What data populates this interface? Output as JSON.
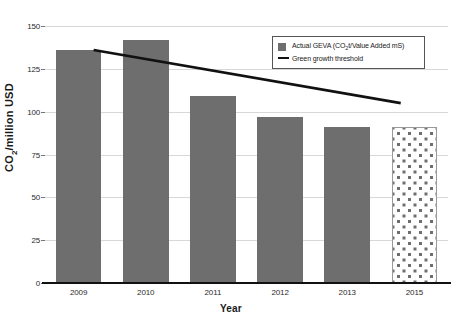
{
  "chart_data": {
    "type": "bar",
    "title": "",
    "xlabel": "Year",
    "ylabel": "CO2/million USD",
    "ylabel_parts": {
      "pre": "CO",
      "sub": "2",
      "post": "/million USD"
    },
    "categories": [
      "2009",
      "2010",
      "2011",
      "2012",
      "2013",
      "2015"
    ],
    "ylim": [
      0,
      150
    ],
    "yticks": [
      0,
      25,
      50,
      75,
      100,
      125,
      150
    ],
    "ytick_labels": [
      "0",
      "25",
      "50",
      "75",
      "100",
      "125",
      "150"
    ],
    "grid": true,
    "legend_position": "top-right",
    "series": [
      {
        "name": "Actual GEVA (CO2t/Value Added mS)",
        "name_parts": {
          "pre": "Actual GEVA (CO",
          "sub": "2",
          "post": "t/Value Added mS)"
        },
        "type": "bar",
        "color": "#6e6e6e",
        "values": [
          136,
          142,
          109,
          97,
          91,
          91
        ],
        "point_styles": [
          "solid",
          "solid",
          "solid",
          "solid",
          "solid",
          "dotted"
        ]
      },
      {
        "name": "Green growth threshold",
        "type": "line",
        "color": "#111111",
        "x": [
          "2009",
          "2015"
        ],
        "values": [
          136,
          105
        ]
      }
    ]
  },
  "legend": {
    "items": [
      {
        "label": "Actual GEVA (CO2t/Value Added mS)",
        "marker": "square-swatch"
      },
      {
        "label": "Green growth threshold",
        "marker": "line-swatch"
      }
    ]
  }
}
